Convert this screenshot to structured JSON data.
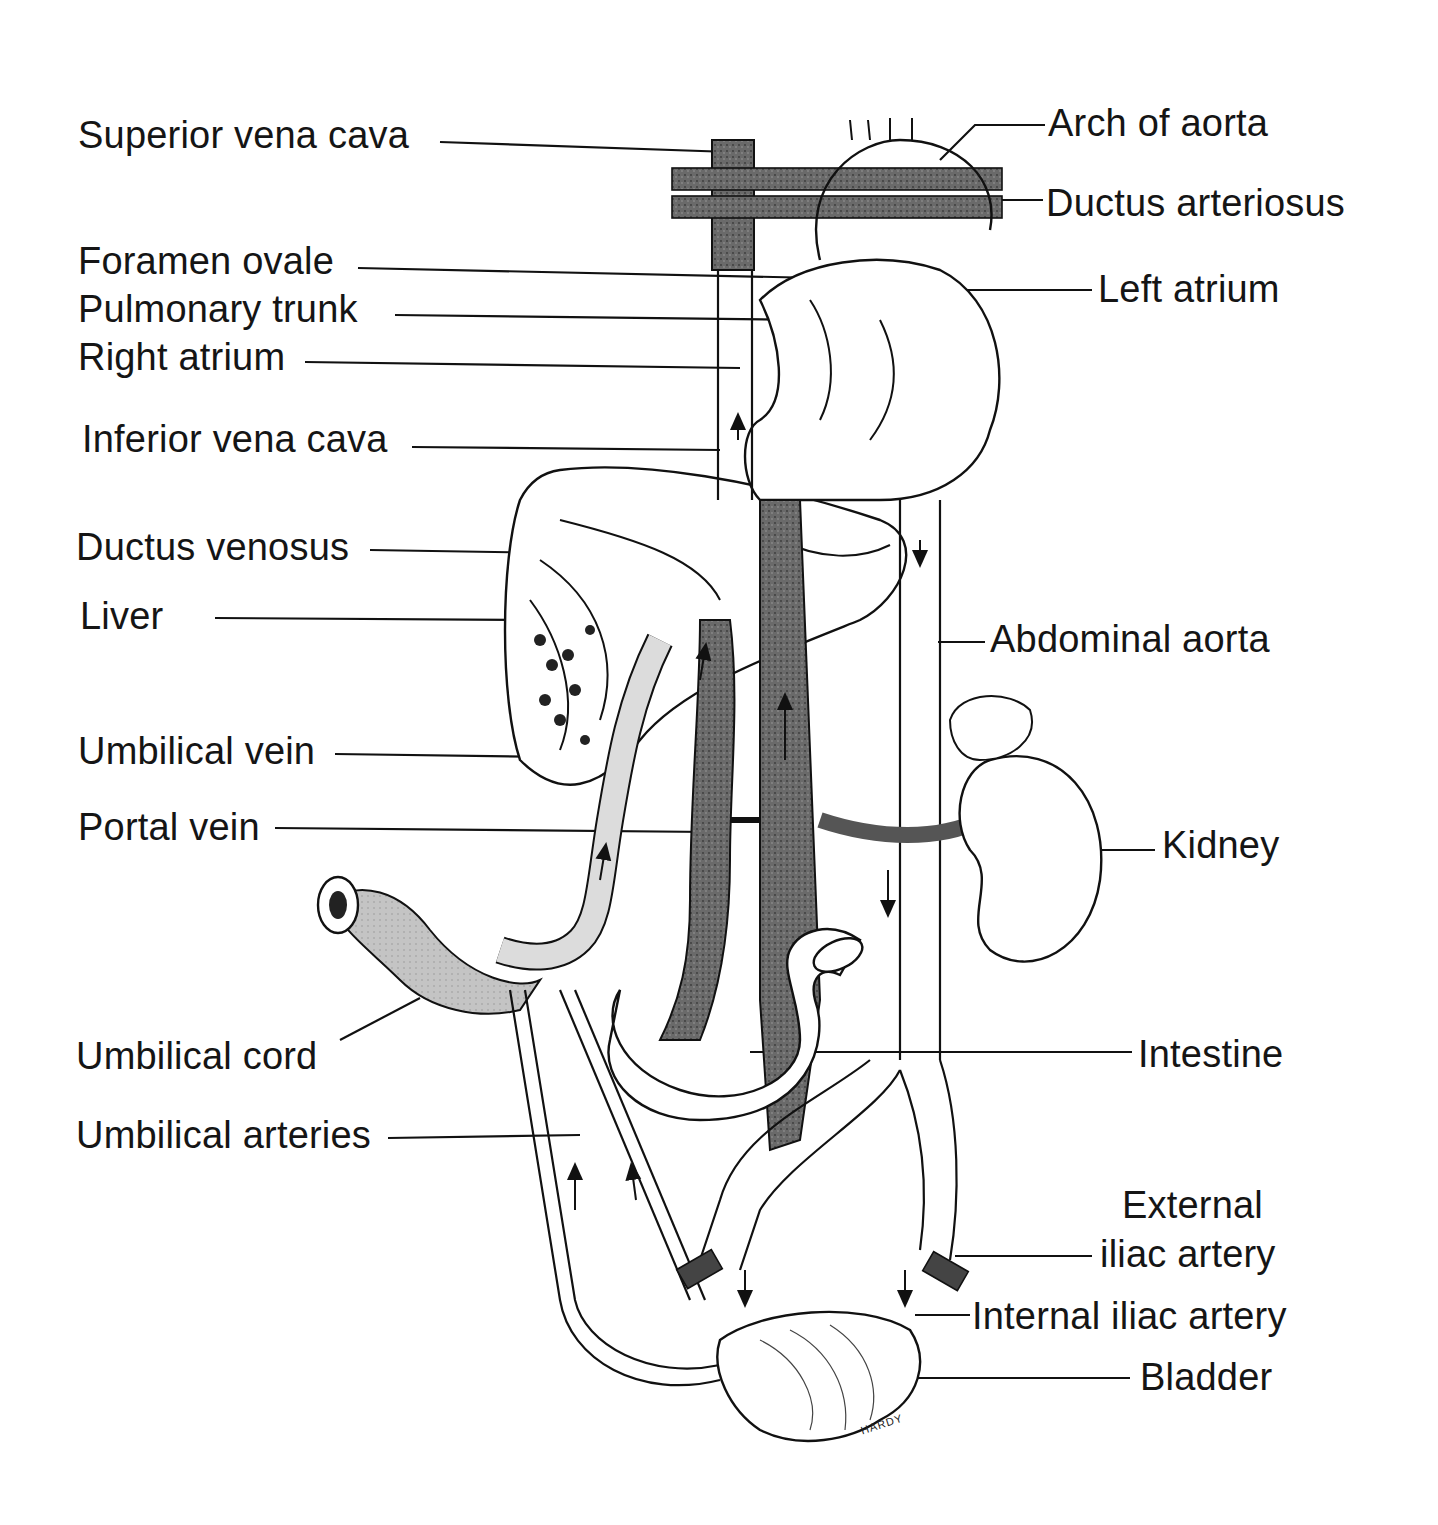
{
  "figure": {
    "signature": "HARDY",
    "colors": {
      "background": "#ffffff",
      "line": "#111111",
      "venous_dark": "#4a4a4a",
      "mixed_mid": "#8a8a8a",
      "light_fill": "#d8d8d8"
    }
  },
  "labels_left": [
    {
      "id": "superior-vena-cava",
      "text": "Superior vena cava"
    },
    {
      "id": "foramen-ovale",
      "text": "Foramen ovale"
    },
    {
      "id": "pulmonary-trunk",
      "text": "Pulmonary trunk"
    },
    {
      "id": "right-atrium",
      "text": "Right atrium"
    },
    {
      "id": "inferior-vena-cava",
      "text": "Inferior vena cava"
    },
    {
      "id": "ductus-venosus",
      "text": "Ductus venosus"
    },
    {
      "id": "liver",
      "text": "Liver"
    },
    {
      "id": "umbilical-vein",
      "text": "Umbilical vein"
    },
    {
      "id": "portal-vein",
      "text": "Portal vein"
    },
    {
      "id": "umbilical-cord",
      "text": "Umbilical cord"
    },
    {
      "id": "umbilical-arteries",
      "text": "Umbilical arteries"
    }
  ],
  "labels_right": [
    {
      "id": "arch-of-aorta",
      "text": "Arch of aorta"
    },
    {
      "id": "ductus-arteriosus",
      "text": "Ductus arteriosus"
    },
    {
      "id": "left-atrium",
      "text": "Left atrium"
    },
    {
      "id": "abdominal-aorta",
      "text": "Abdominal aorta"
    },
    {
      "id": "kidney",
      "text": "Kidney"
    },
    {
      "id": "intestine",
      "text": "Intestine"
    },
    {
      "id": "external-iliac-artery-1",
      "text": "External"
    },
    {
      "id": "external-iliac-artery-2",
      "text": "iliac artery"
    },
    {
      "id": "internal-iliac-artery",
      "text": "Internal iliac artery"
    },
    {
      "id": "bladder",
      "text": "Bladder"
    }
  ]
}
